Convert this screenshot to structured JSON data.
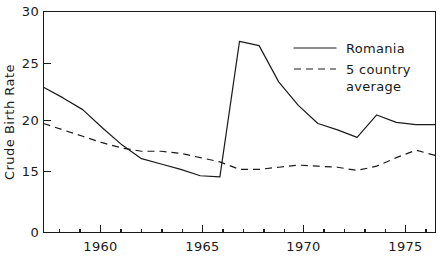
{
  "chart_data": {
    "type": "line",
    "title": "",
    "xlabel": "",
    "ylabel": "Crude Birth Rate",
    "xlim": [
      1957,
      1977
    ],
    "ylim": [
      13.5,
      30
    ],
    "y_axis_break": true,
    "y_axis_break_note": "axis shows 0 at baseline then jumps to 15",
    "grid": false,
    "legend_position": "top-right-inside",
    "y_ticks": [
      {
        "label": "0",
        "value": 0
      },
      {
        "label": "15",
        "value": 15
      },
      {
        "label": "20",
        "value": 20
      },
      {
        "label": "25",
        "value": 25
      },
      {
        "label": "30",
        "value": 30
      }
    ],
    "x_ticks_major": [
      {
        "label": "1960",
        "value": 1960
      },
      {
        "label": "1965",
        "value": 1965
      },
      {
        "label": "1970",
        "value": 1970
      },
      {
        "label": "1975",
        "value": 1975
      }
    ],
    "x_ticks_minor": [
      1958,
      1959,
      1961,
      1962,
      1963,
      1964,
      1966,
      1967,
      1968,
      1969,
      1971,
      1972,
      1973,
      1974,
      1976
    ],
    "x": [
      1957,
      1958,
      1959,
      1960,
      1961,
      1962,
      1963,
      1964,
      1965,
      1966,
      1967,
      1968,
      1969,
      1970,
      1971,
      1972,
      1973,
      1974,
      1975,
      1976,
      1977
    ],
    "series": [
      {
        "name": "Romania",
        "style": "solid",
        "color": "#1a1a1a",
        "values": [
          22.9,
          21.9,
          20.8,
          19.1,
          17.5,
          16.2,
          15.7,
          15.2,
          14.6,
          14.5,
          27.2,
          26.8,
          23.4,
          21.2,
          19.5,
          18.9,
          18.2,
          20.3,
          19.6,
          19.4,
          19.4
        ]
      },
      {
        "name": "5 country average",
        "style": "dashed",
        "color": "#1a1a1a",
        "values": [
          19.5,
          18.9,
          18.3,
          17.7,
          17.2,
          16.9,
          16.9,
          16.7,
          16.3,
          15.9,
          15.2,
          15.2,
          15.4,
          15.6,
          15.5,
          15.4,
          15.1,
          15.5,
          16.3,
          17.0,
          16.5
        ]
      }
    ],
    "legend": [
      {
        "label": "Romania",
        "style": "solid"
      },
      {
        "label": "5 country",
        "style": "dashed"
      },
      {
        "label": "average",
        "style": "none"
      }
    ]
  },
  "legend": {
    "romania_label": "Romania",
    "average_line1": "5 country",
    "average_line2": "average"
  },
  "axes": {
    "y_title": "Crude  Birth  Rate",
    "y_tick_0": "0",
    "y_tick_15": "15",
    "y_tick_20": "20",
    "y_tick_25": "25",
    "y_tick_30": "30",
    "x_tick_1960": "1960",
    "x_tick_1965": "1965",
    "x_tick_1970": "1970",
    "x_tick_1975": "1975"
  }
}
